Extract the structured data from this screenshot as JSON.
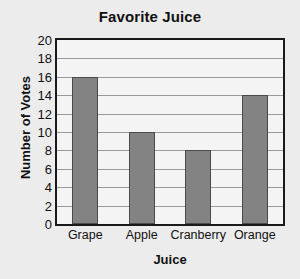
{
  "chart_data": {
    "type": "bar",
    "title": "Favorite Juice",
    "xlabel": "Juice",
    "ylabel": "Number of Votes",
    "categories": [
      "Grape",
      "Apple",
      "Cranberry",
      "Orange"
    ],
    "values": [
      16,
      10,
      8,
      14
    ],
    "ylim": [
      0,
      20
    ],
    "ytick_step": 2,
    "yticks": [
      0,
      2,
      4,
      6,
      8,
      10,
      12,
      14,
      16,
      18,
      20
    ],
    "ytick_labels": [
      "0",
      "2",
      "4",
      "6",
      "8",
      "10",
      "12",
      "14",
      "16",
      "18",
      "20"
    ],
    "grid": "horizontal",
    "legend": "none",
    "colors": {
      "page_background": "#ececec",
      "plot_background": "#f4f4f4",
      "bar_fill": "#838383",
      "bar_border": "#4a4a4a",
      "gridline": "#9a9a9a",
      "frame": "#1a1a1a",
      "text": "#111111"
    }
  }
}
